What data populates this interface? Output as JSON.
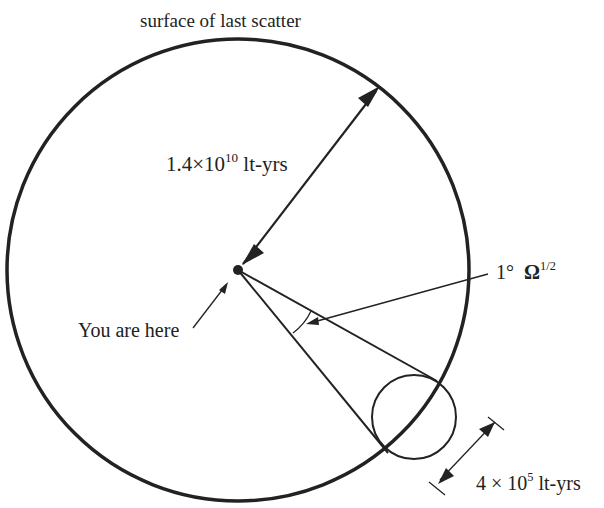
{
  "diagram": {
    "title": "surface of last scatter",
    "radius_label": {
      "mantissa": "1.4",
      "times": "×",
      "base": "10",
      "exponent": "10",
      "unit": "lt-yrs"
    },
    "angle_label": {
      "degree": "1°",
      "omega": "Ω",
      "exponent": "1/2"
    },
    "observer_label": "You are here",
    "horizon_size_label": {
      "mantissa": "4",
      "times": "×",
      "base": "10",
      "exponent": "5",
      "unit": "lt-yrs"
    },
    "colors": {
      "ink": "#222222",
      "background": "#ffffff"
    },
    "geometry": {
      "big_circle": {
        "cx": 238,
        "cy": 270,
        "r": 230
      },
      "observer": {
        "cx": 238,
        "cy": 270,
        "r": 5
      },
      "small_circle": {
        "cx": 414,
        "cy": 417,
        "r": 42
      }
    }
  }
}
